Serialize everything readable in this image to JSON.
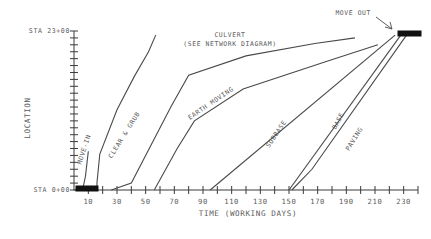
{
  "chart_data": {
    "type": "line",
    "title": "",
    "xlabel": "TIME (WORKING DAYS)",
    "ylabel": "LOCATION",
    "xlim": [
      0,
      240
    ],
    "ylim": [
      0,
      23
    ],
    "grid": false,
    "legend_position": "inline-annotations",
    "x_ticks": [
      10,
      30,
      50,
      70,
      90,
      110,
      130,
      150,
      170,
      190,
      210,
      230
    ],
    "x_minor_tick_step": 10,
    "y_tick_labels": {
      "top": "STA 23+00",
      "bottom": "STA 0+00"
    },
    "y_tick_count": 23,
    "y_axis_units": "station (STA 0+00 to STA 23+00)",
    "series": [
      {
        "name": "MOVE-IN",
        "label": "MOVE-IN",
        "label_rotation": -72,
        "points": [
          [
            6,
            0.0
          ],
          [
            8,
            2.0
          ],
          [
            10,
            5.6
          ]
        ]
      },
      {
        "name": "CLEAR & GRUB",
        "label": "CLEAR & GRUB",
        "label_rotation": -58,
        "points": [
          [
            16,
            0.0
          ],
          [
            16,
            1.0
          ],
          [
            18,
            5.2
          ],
          [
            30,
            11.6
          ],
          [
            42,
            16.4
          ],
          [
            52,
            20.0
          ],
          [
            57,
            22.4
          ]
        ]
      },
      {
        "name": "CULVERT",
        "label": "CULVERT",
        "note": "(SEE NETWORK DIAGRAM)",
        "label_rotation": 0,
        "points": [
          [
            26,
            0.0
          ],
          [
            40,
            1.0
          ],
          [
            68,
            12.2
          ],
          [
            80,
            16.6
          ],
          [
            120,
            19.4
          ],
          [
            168,
            21.2
          ],
          [
            196,
            22.0
          ]
        ]
      },
      {
        "name": "EARTH MOVING",
        "label": "EARTH MOVING",
        "label_rotation": -34,
        "points": [
          [
            56,
            0.0
          ],
          [
            72,
            6.0
          ],
          [
            84,
            10.0
          ],
          [
            118,
            14.6
          ],
          [
            176,
            18.6
          ],
          [
            212,
            21.0
          ]
        ]
      },
      {
        "name": "SUBBASE",
        "label": "SUBBASE",
        "label_rotation": -56,
        "points": [
          [
            95,
            0.0
          ],
          [
            224,
            22.4
          ]
        ]
      },
      {
        "name": "BASE",
        "label": "BASE",
        "label_rotation": -62,
        "points": [
          [
            150,
            0.0
          ],
          [
            228,
            22.4
          ]
        ]
      },
      {
        "name": "PAVING",
        "label": "PAVING",
        "label_rotation": -58,
        "points": [
          [
            152,
            0.0
          ],
          [
            166,
            3.0
          ],
          [
            232,
            22.4
          ]
        ]
      }
    ],
    "annotations": [
      {
        "name": "move-out",
        "label": "MOVE OUT",
        "target_bar": {
          "x_start": 228,
          "x_end": 240,
          "y": 22.6
        }
      },
      {
        "name": "move-in-bar",
        "label": "",
        "target_bar": {
          "x_start": 3,
          "x_end": 16,
          "y": 0.0
        }
      }
    ]
  },
  "axes": {
    "y_title": "LOCATION",
    "x_title": "TIME (WORKING DAYS)",
    "y_top_label": "STA 23+00",
    "y_bottom_label": "STA 0+00",
    "x_tick_labels": [
      "10",
      "30",
      "50",
      "70",
      "90",
      "110",
      "130",
      "150",
      "170",
      "190",
      "210",
      "230"
    ]
  },
  "labels": {
    "move_in": "MOVE-IN",
    "clear_grub": "CLEAR & GRUB",
    "culvert": "CULVERT",
    "culvert_note": "(SEE NETWORK DIAGRAM)",
    "earth_moving": "EARTH MOVING",
    "subbase": "SUBBASE",
    "base": "BASE",
    "paving": "PAVING",
    "move_out": "MOVE OUT"
  },
  "colors": {
    "line": "#4a4a4a",
    "axis": "#3a3a3a",
    "text": "#5b5b5b",
    "bar": "#111111",
    "background": "#ffffff"
  }
}
